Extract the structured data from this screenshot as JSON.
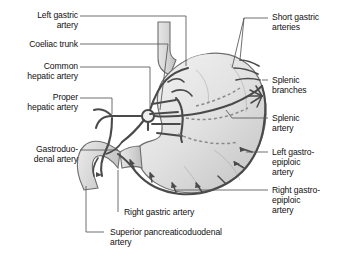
{
  "figure": {
    "kind": "anatomical-illustration",
    "organs": [
      "stomach",
      "oesophagus",
      "duodenum"
    ],
    "palette": {
      "background": "#ffffff",
      "organ_fill_light": "#e9e9e9",
      "organ_fill_mid": "#d8d8d8",
      "organ_fill_dark": "#c2c2c2",
      "organ_outline": "#6e6e6e",
      "vessel": "#4a4a4a",
      "vessel_dashed": "#8a8a8a",
      "leader_line": "#555555",
      "text": "#111111"
    }
  },
  "labels": {
    "left": [
      {
        "id": "left-gastric-artery",
        "text": "Left gastric\nartery"
      },
      {
        "id": "coeliac-trunk",
        "text": "Coeliac trunk"
      },
      {
        "id": "common-hepatic-artery",
        "text": "Common\nhepatic artery"
      },
      {
        "id": "proper-hepatic-artery",
        "text": "Proper\nhepatic artery"
      },
      {
        "id": "gastroduodenal-artery",
        "text": "Gastroduo-\ndenal artery"
      }
    ],
    "right": [
      {
        "id": "short-gastric-arteries",
        "text": "Short gastric\narteries"
      },
      {
        "id": "splenic-branches",
        "text": "Splenic\nbranches"
      },
      {
        "id": "splenic-artery",
        "text": "Splenic\nartery"
      },
      {
        "id": "left-gastroepiploic-artery",
        "text": "Left gastro-\nepiploic\nartery"
      },
      {
        "id": "right-gastroepiploic-artery",
        "text": "Right gastro-\nepiploic\nartery"
      }
    ],
    "bottom": [
      {
        "id": "right-gastric-artery",
        "text": "Right gastric artery"
      },
      {
        "id": "superior-pancreaticoduodenal-artery",
        "text": "Superior pancreaticoduodenal\nartery"
      }
    ]
  }
}
